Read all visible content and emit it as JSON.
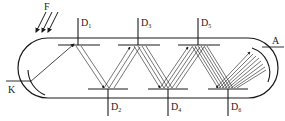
{
  "diagram": {
    "type": "photomultiplier-tube-schematic",
    "labels": {
      "light": "F",
      "cathode": "K",
      "anode": "A",
      "dynodes": [
        {
          "base": "D",
          "sub": "1"
        },
        {
          "base": "D",
          "sub": "2"
        },
        {
          "base": "D",
          "sub": "3"
        },
        {
          "base": "D",
          "sub": "4"
        },
        {
          "base": "D",
          "sub": "5"
        },
        {
          "base": "D",
          "sub": "6"
        }
      ]
    },
    "colors": {
      "stroke": "#1a1a1a",
      "background": "#ffffff"
    }
  }
}
